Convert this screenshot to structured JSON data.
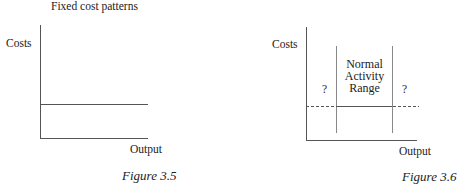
{
  "figures": [
    {
      "title": "Fixed cost patterns",
      "y_label": "Costs",
      "x_label": "Output",
      "caption": "Figure 3.5"
    },
    {
      "y_label": "Costs",
      "x_label": "Output",
      "caption": "Figure 3.6",
      "range_label_lines": [
        "Normal",
        "Activity",
        "Range"
      ],
      "left_unknown": "?",
      "right_unknown": "?"
    }
  ],
  "colors": {
    "line": "#555555",
    "text": "#222222",
    "background": "#ffffff"
  }
}
